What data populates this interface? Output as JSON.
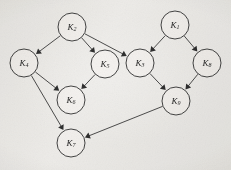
{
  "figure": {
    "type": "directed-graph",
    "title": "",
    "background_color": "#f3f2f0",
    "node_stroke_color": "#2b2b2b",
    "edge_color": "#2b2b2b",
    "label_color": "#1d1d1d",
    "node_radius": 14,
    "nodes": [
      {
        "id": "K2",
        "base": "K",
        "sub": "2",
        "label": "K2",
        "x": 72,
        "y": 27
      },
      {
        "id": "K1",
        "base": "K",
        "sub": "1",
        "label": "K1",
        "x": 175,
        "y": 25
      },
      {
        "id": "K4",
        "base": "K",
        "sub": "4",
        "label": "K4",
        "x": 24,
        "y": 63
      },
      {
        "id": "K5",
        "base": "K",
        "sub": "5",
        "label": "K5",
        "x": 105,
        "y": 64
      },
      {
        "id": "K3",
        "base": "K",
        "sub": "3",
        "label": "K3",
        "x": 140,
        "y": 63
      },
      {
        "id": "K8",
        "base": "K",
        "sub": "8",
        "label": "K8",
        "x": 207,
        "y": 63
      },
      {
        "id": "K6",
        "base": "K",
        "sub": "6",
        "label": "K6",
        "x": 71,
        "y": 100
      },
      {
        "id": "K9",
        "base": "K",
        "sub": "9",
        "label": "K9",
        "x": 176,
        "y": 101
      },
      {
        "id": "K7",
        "base": "K",
        "sub": "7",
        "label": "K7",
        "x": 71,
        "y": 143
      }
    ],
    "edges": [
      {
        "from": "K2",
        "to": "K4",
        "directed": true
      },
      {
        "from": "K2",
        "to": "K5",
        "directed": true
      },
      {
        "from": "K2",
        "to": "K3",
        "directed": true
      },
      {
        "from": "K1",
        "to": "K3",
        "directed": true
      },
      {
        "from": "K1",
        "to": "K8",
        "directed": true
      },
      {
        "from": "K4",
        "to": "K6",
        "directed": true
      },
      {
        "from": "K4",
        "to": "K7",
        "directed": true
      },
      {
        "from": "K5",
        "to": "K6",
        "directed": true
      },
      {
        "from": "K3",
        "to": "K9",
        "directed": true
      },
      {
        "from": "K8",
        "to": "K9",
        "directed": true
      },
      {
        "from": "K9",
        "to": "K7",
        "directed": true
      }
    ]
  }
}
